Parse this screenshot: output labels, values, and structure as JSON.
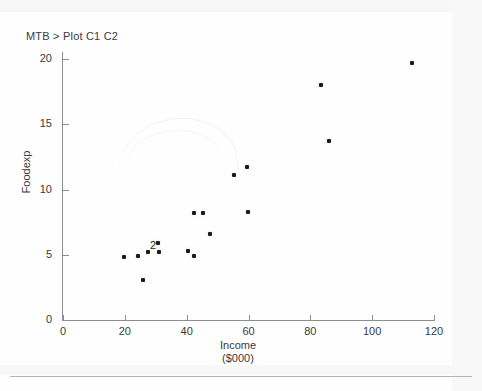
{
  "terminal": {
    "prompt": "MTB > Plot C1 C2"
  },
  "chart_data": {
    "type": "scatter",
    "title": "",
    "xlabel": "Income",
    "xlabel_units": "($000)",
    "ylabel": "Foodexp",
    "xlim": [
      0,
      120
    ],
    "ylim": [
      0,
      20
    ],
    "xticks": [
      0,
      20,
      40,
      60,
      80,
      100,
      120
    ],
    "yticks": [
      0,
      5,
      10,
      15,
      20
    ],
    "grid": false,
    "legend": null,
    "point_color": "#1b1b1b",
    "axis_color": "#8d8d8d",
    "overlap_marker": {
      "label": "2",
      "x": 27.5,
      "y": 5.6,
      "note": "two coincident observations"
    },
    "points": [
      {
        "x": 19.8,
        "y": 4.8
      },
      {
        "x": 24.3,
        "y": 4.9
      },
      {
        "x": 25.9,
        "y": 3.1
      },
      {
        "x": 27.5,
        "y": 5.2
      },
      {
        "x": 30.7,
        "y": 5.9
      },
      {
        "x": 31.1,
        "y": 5.2
      },
      {
        "x": 40.5,
        "y": 5.3
      },
      {
        "x": 42.4,
        "y": 4.9
      },
      {
        "x": 42.4,
        "y": 8.2
      },
      {
        "x": 45.3,
        "y": 8.2
      },
      {
        "x": 47.6,
        "y": 6.6
      },
      {
        "x": 55.3,
        "y": 11.1
      },
      {
        "x": 59.5,
        "y": 11.7
      },
      {
        "x": 59.9,
        "y": 8.3
      },
      {
        "x": 83.5,
        "y": 18.0
      },
      {
        "x": 86.1,
        "y": 13.7
      },
      {
        "x": 112.9,
        "y": 19.7
      }
    ]
  }
}
